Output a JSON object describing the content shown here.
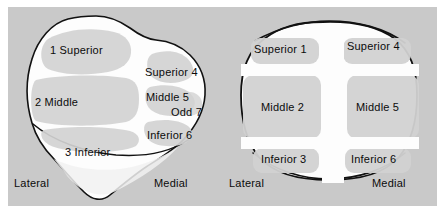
{
  "figure": {
    "background_color": "#c9c9c9",
    "bone_fill_color": "#fdfdfd",
    "facet_fill_color": "#d2d2d2",
    "outline_color": "#111111",
    "text_color": "#0b0b0b"
  },
  "views": [
    {
      "id": "lateral-view",
      "name": "Oblique / lateral patellar view",
      "facets": [
        {
          "key": "superior-1",
          "label": "1  Superior"
        },
        {
          "key": "middle-2",
          "label": "2  Middle"
        },
        {
          "key": "inferior-3",
          "label": "3  Inferior"
        },
        {
          "key": "superior-4",
          "label": "Superior  4"
        },
        {
          "key": "middle-5",
          "label": "Middle  5"
        },
        {
          "key": "odd-7",
          "label": "Odd  7"
        },
        {
          "key": "inferior-6",
          "label": "Inferior  6"
        }
      ],
      "directions": {
        "lateral": "Lateral",
        "medial": "Medial"
      }
    },
    {
      "id": "frontal-view",
      "name": "Frontal patellar view",
      "facets": [
        {
          "key": "superior-1",
          "label": "Superior 1"
        },
        {
          "key": "superior-4",
          "label": "Superior 4"
        },
        {
          "key": "middle-2",
          "label": "Middle 2"
        },
        {
          "key": "middle-5",
          "label": "Middle 5"
        },
        {
          "key": "inferior-3",
          "label": "Inferior 3"
        },
        {
          "key": "inferior-6",
          "label": "Inferior 6"
        }
      ],
      "directions": {
        "lateral": "Lateral",
        "medial": "Medial"
      }
    }
  ]
}
